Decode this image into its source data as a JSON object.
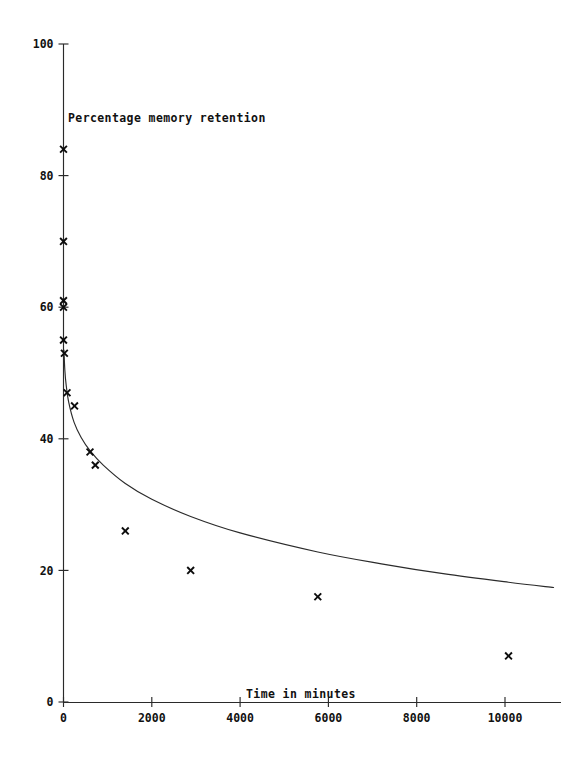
{
  "chart_data": {
    "type": "scatter",
    "title": "",
    "xlabel": "Time in minutes",
    "ylabel": "Percentage memory retention",
    "xlim": [
      0,
      11200
    ],
    "ylim": [
      0,
      100
    ],
    "xticks": [
      0,
      2000,
      4000,
      6000,
      8000,
      10000
    ],
    "xtick_labels": [
      "0",
      "2000",
      "4000",
      "6000",
      "8000",
      "10000"
    ],
    "yticks": [
      0,
      20,
      40,
      60,
      80,
      100
    ],
    "ytick_labels": [
      "0",
      "20",
      "40",
      "60",
      "80",
      "100"
    ],
    "grid": false,
    "legend": null,
    "marker_symbol": "x",
    "series": [
      {
        "name": "Observed retention",
        "type": "scatter",
        "marker": "x",
        "points": [
          {
            "x": 0,
            "y": 84
          },
          {
            "x": 0,
            "y": 70
          },
          {
            "x": 0,
            "y": 60
          },
          {
            "x": 0,
            "y": 61
          },
          {
            "x": 0,
            "y": 55
          },
          {
            "x": 20,
            "y": 53
          },
          {
            "x": 80,
            "y": 47
          },
          {
            "x": 250,
            "y": 45
          },
          {
            "x": 600,
            "y": 38
          },
          {
            "x": 720,
            "y": 36
          },
          {
            "x": 1400,
            "y": 26
          },
          {
            "x": 2880,
            "y": 20
          },
          {
            "x": 5760,
            "y": 16
          },
          {
            "x": 10080,
            "y": 7
          }
        ]
      },
      {
        "name": "Fitted forgetting curve",
        "type": "line",
        "points": [
          {
            "x": 10,
            "y": 53.5
          },
          {
            "x": 30,
            "y": 50.5
          },
          {
            "x": 60,
            "y": 48.2
          },
          {
            "x": 120,
            "y": 45.5
          },
          {
            "x": 240,
            "y": 42.5
          },
          {
            "x": 400,
            "y": 40.2
          },
          {
            "x": 600,
            "y": 38.2
          },
          {
            "x": 900,
            "y": 36.0
          },
          {
            "x": 1400,
            "y": 33.2
          },
          {
            "x": 2000,
            "y": 30.8
          },
          {
            "x": 2880,
            "y": 28.2
          },
          {
            "x": 4000,
            "y": 25.7
          },
          {
            "x": 5760,
            "y": 22.8
          },
          {
            "x": 7200,
            "y": 21.0
          },
          {
            "x": 8600,
            "y": 19.5
          },
          {
            "x": 10080,
            "y": 18.2
          },
          {
            "x": 11100,
            "y": 17.4
          }
        ]
      }
    ]
  },
  "axes": {
    "x_axis_title": "Time in minutes",
    "y_axis_title": "Percentage memory retention"
  }
}
